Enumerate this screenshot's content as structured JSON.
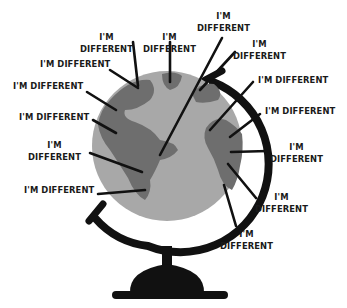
{
  "illustration": {
    "subject": "globe",
    "colors": {
      "ocean": "#a8a8a8",
      "land": "#6e6e6e",
      "stand": "#111111",
      "pointer": "#111111",
      "text": "#1a1a1a",
      "background": "#ffffff"
    }
  },
  "labels": [
    {
      "id": "l1",
      "lines": [
        "I'M",
        "DIFFERENT"
      ]
    },
    {
      "id": "l2",
      "lines": [
        "I'M",
        "DIFFERENT"
      ]
    },
    {
      "id": "l3",
      "lines": [
        "I'M",
        "DIFFERENT"
      ]
    },
    {
      "id": "l4",
      "lines": [
        "I'M DIFFERENT"
      ]
    },
    {
      "id": "l5",
      "lines": [
        "I'M",
        "DIFFERENT"
      ]
    },
    {
      "id": "l6",
      "lines": [
        "I'M DIFFERENT"
      ]
    },
    {
      "id": "l7",
      "lines": [
        "I'M DIFFERENT"
      ]
    },
    {
      "id": "l8",
      "lines": [
        "I'M DIFFERENT"
      ]
    },
    {
      "id": "l9",
      "lines": [
        "I'M DIFFERENT"
      ]
    },
    {
      "id": "l10",
      "lines": [
        "I'M",
        "DIFFERENT"
      ]
    },
    {
      "id": "l11",
      "lines": [
        "I'M",
        "DIFFERENT"
      ]
    },
    {
      "id": "l12",
      "lines": [
        "I'M DIFFERENT"
      ]
    },
    {
      "id": "l13",
      "lines": [
        "I'M",
        "DIFFERENT"
      ]
    },
    {
      "id": "l14",
      "lines": [
        "I'M",
        "DIFFERENT"
      ]
    }
  ]
}
